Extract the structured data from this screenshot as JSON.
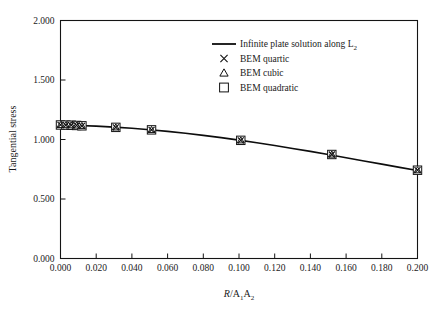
{
  "chart_data": {
    "type": "line",
    "title": "",
    "xlabel": "R/A₁A₂",
    "ylabel": "Tangential stress",
    "xlim": [
      0.0,
      0.2
    ],
    "ylim": [
      0.0,
      2.0
    ],
    "grid": false,
    "legend_position": "top-right",
    "xticks": [
      "0.000",
      "0.020",
      "0.040",
      "0.060",
      "0.080",
      "0.100",
      "0.120",
      "0.140",
      "0.160",
      "0.180",
      "0.200"
    ],
    "xtick_values": [
      0.0,
      0.02,
      0.04,
      0.06,
      0.08,
      0.1,
      0.12,
      0.14,
      0.16,
      0.18,
      0.2
    ],
    "yticks": [
      "0.000",
      "0.500",
      "1.000",
      "1.500",
      "2.000"
    ],
    "ytick_values": [
      0.0,
      0.5,
      1.0,
      1.5,
      2.0
    ],
    "series": [
      {
        "name": "Infinite plate solution along L2",
        "marker": "line",
        "x": [
          0.0,
          0.01,
          0.02,
          0.03,
          0.04,
          0.05,
          0.06,
          0.07,
          0.08,
          0.09,
          0.1,
          0.11,
          0.12,
          0.13,
          0.14,
          0.15,
          0.16,
          0.17,
          0.18,
          0.19,
          0.2
        ],
        "values": [
          1.122,
          1.118,
          1.112,
          1.104,
          1.094,
          1.082,
          1.068,
          1.052,
          1.035,
          1.016,
          0.995,
          0.973,
          0.95,
          0.925,
          0.9,
          0.874,
          0.847,
          0.82,
          0.793,
          0.766,
          0.74
        ]
      },
      {
        "name": "BEM quartic",
        "marker": "cross",
        "x": [
          0.0,
          0.003,
          0.006,
          0.009,
          0.012,
          0.031,
          0.051,
          0.101,
          0.152,
          0.2
        ],
        "values": [
          1.122,
          1.121,
          1.12,
          1.118,
          1.115,
          1.102,
          1.081,
          0.993,
          0.874,
          0.742
        ]
      },
      {
        "name": "BEM cubic",
        "marker": "triangle",
        "x": [
          0.0,
          0.003,
          0.006,
          0.009,
          0.012,
          0.031,
          0.051,
          0.101,
          0.152,
          0.2
        ],
        "values": [
          1.122,
          1.121,
          1.12,
          1.118,
          1.115,
          1.102,
          1.081,
          0.993,
          0.874,
          0.742
        ]
      },
      {
        "name": "BEM quadratic",
        "marker": "square",
        "x": [
          0.0,
          0.003,
          0.006,
          0.009,
          0.012,
          0.031,
          0.051,
          0.101,
          0.152,
          0.2
        ],
        "values": [
          1.122,
          1.121,
          1.12,
          1.118,
          1.115,
          1.102,
          1.081,
          0.993,
          0.874,
          0.742
        ]
      }
    ]
  },
  "legend": {
    "entries": [
      {
        "label_main": "Infinite plate solution along L",
        "label_sub": "2",
        "marker": "line"
      },
      {
        "label_main": "BEM quartic",
        "label_sub": "",
        "marker": "cross"
      },
      {
        "label_main": "BEM cubic",
        "label_sub": "",
        "marker": "triangle"
      },
      {
        "label_main": "BEM quadratic",
        "label_sub": "",
        "marker": "square"
      }
    ]
  },
  "axes": {
    "ylabel": "Tangential stress",
    "xlabel_r": "R",
    "xlabel_slash": "/A",
    "xlabel_sub1": "1",
    "xlabel_a2": "A",
    "xlabel_sub2": "2"
  },
  "colors": {
    "line": "#0d0d0d",
    "frame": "#141414",
    "text": "#1a1a1a",
    "background": "#ffffff"
  }
}
